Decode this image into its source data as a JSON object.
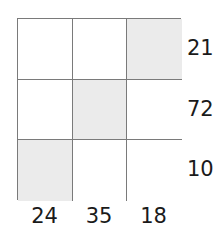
{
  "grid": {
    "rows": 3,
    "cols": 3,
    "shaded_cells": [
      [
        0,
        2
      ],
      [
        1,
        1
      ],
      [
        2,
        0
      ]
    ],
    "shade_color": "#ebebeb",
    "line_color": "#7a7a7a"
  },
  "row_labels": [
    "21",
    "72",
    "10"
  ],
  "col_labels": [
    "24",
    "35",
    "18"
  ]
}
